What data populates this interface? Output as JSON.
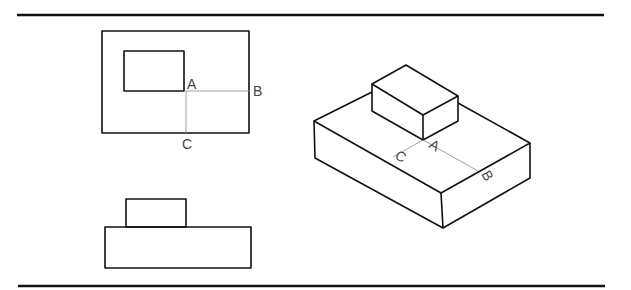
{
  "figure": {
    "plan_view": {
      "labels": {
        "a": "A",
        "b": "B",
        "c": "C"
      }
    },
    "front_view": {},
    "isometric_view": {
      "labels": {
        "a": "A",
        "b": "B",
        "c": "C"
      }
    }
  },
  "colors": {
    "line": "#111111",
    "construction": "#888888",
    "background": "#ffffff"
  }
}
